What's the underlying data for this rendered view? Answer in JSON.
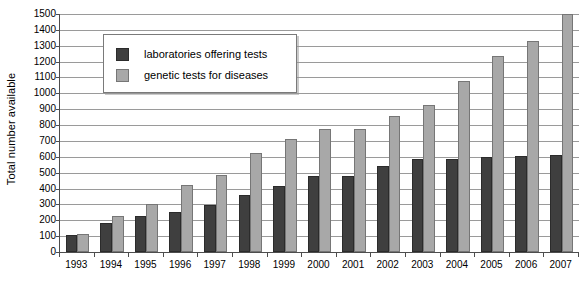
{
  "chart_data": {
    "type": "bar",
    "title": "",
    "subtitle": "",
    "xlabel": "",
    "ylabel": "Total number available",
    "ylim": [
      0,
      1500
    ],
    "ytick_step": 100,
    "yticks": [
      0,
      100,
      200,
      300,
      400,
      500,
      600,
      700,
      800,
      900,
      1000,
      1100,
      1200,
      1300,
      1400,
      1500
    ],
    "ytick_labels": [
      "0",
      "100",
      "200",
      "300",
      "400",
      "500",
      "600",
      "700",
      "800",
      "900",
      "1000",
      "1100",
      "1200",
      "1300",
      "1400",
      "1500"
    ],
    "grid": true,
    "grid_axis": "y",
    "legend_position": "upper-left-inside",
    "categories": [
      "1993",
      "1994",
      "1995",
      "1996",
      "1997",
      "1998",
      "1999",
      "2000",
      "2001",
      "2002",
      "2003",
      "2004",
      "2005",
      "2006",
      "2007"
    ],
    "series": [
      {
        "name": "laboratories offering tests",
        "color": "#3f3f3f",
        "values": [
          105,
          185,
          225,
          252,
          298,
          357,
          418,
          482,
          478,
          545,
          588,
          588,
          600,
          605,
          612
        ]
      },
      {
        "name": "genetic tests for diseases",
        "color": "#a8a8a8",
        "values": [
          112,
          225,
          300,
          422,
          488,
          625,
          710,
          775,
          775,
          855,
          925,
          1080,
          1235,
          1330,
          1500
        ]
      }
    ]
  },
  "legend": {
    "items": [
      {
        "label": "laboratories offering tests",
        "swatch": "dark"
      },
      {
        "label": "genetic tests for diseases",
        "swatch": "light"
      }
    ]
  },
  "axes": {
    "y_title": "Total number available"
  }
}
